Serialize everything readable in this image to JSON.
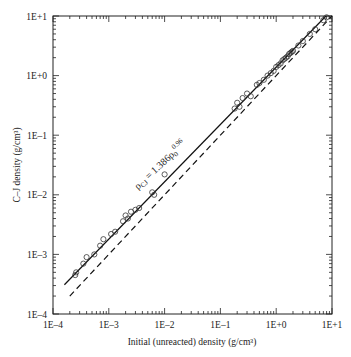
{
  "chart_data": {
    "type": "scatter",
    "title": "",
    "xlabel": "Initial (unreacted) density (g/cm³)",
    "ylabel": "C–J density (g/cm³)",
    "xscale": "log",
    "yscale": "log",
    "xlim": [
      0.0001,
      10
    ],
    "ylim": [
      0.0001,
      10
    ],
    "x_ticks": [
      "1E–4",
      "1E–3",
      "1E–2",
      "1E–1",
      "1E+0",
      "1E+1"
    ],
    "y_ticks": [
      "1E–4",
      "1E–3",
      "1E–2",
      "1E–1",
      "1E+0",
      "1E+1"
    ],
    "grid": false,
    "legend": null,
    "annotation": {
      "text": "ρCJ = 1.386ρ0^0.96",
      "main": "ρ",
      "sub1": "CJ",
      "eq": " = 1.386ρ",
      "sub2": "0",
      "sup": "0.96"
    },
    "series": [
      {
        "name": "data",
        "style": "open-circle",
        "points": [
          [
            0.00025,
            0.00045
          ],
          [
            0.00026,
            0.0005
          ],
          [
            0.00035,
            0.0007
          ],
          [
            0.0004,
            0.0009
          ],
          [
            0.00055,
            0.001
          ],
          [
            0.0007,
            0.0014
          ],
          [
            0.0008,
            0.0018
          ],
          [
            0.0011,
            0.0022
          ],
          [
            0.0013,
            0.0024
          ],
          [
            0.0018,
            0.0036
          ],
          [
            0.002,
            0.0045
          ],
          [
            0.0022,
            0.004
          ],
          [
            0.0025,
            0.0052
          ],
          [
            0.003,
            0.0056
          ],
          [
            0.0035,
            0.006
          ],
          [
            0.006,
            0.011
          ],
          [
            0.0065,
            0.01
          ],
          [
            0.01,
            0.022
          ],
          [
            0.18,
            0.28
          ],
          [
            0.2,
            0.35
          ],
          [
            0.22,
            0.3
          ],
          [
            0.25,
            0.42
          ],
          [
            0.3,
            0.5
          ],
          [
            0.35,
            0.45
          ],
          [
            0.45,
            0.7
          ],
          [
            0.5,
            0.75
          ],
          [
            0.6,
            0.85
          ],
          [
            0.7,
            1.0
          ],
          [
            0.8,
            1.1
          ],
          [
            0.9,
            1.2
          ],
          [
            1.0,
            1.4
          ],
          [
            1.1,
            1.5
          ],
          [
            1.2,
            1.6
          ],
          [
            1.3,
            1.8
          ],
          [
            1.4,
            1.9
          ],
          [
            1.5,
            2.0
          ],
          [
            1.6,
            2.1
          ],
          [
            1.7,
            2.3
          ],
          [
            1.8,
            2.4
          ],
          [
            1.9,
            2.5
          ],
          [
            2.0,
            2.6
          ],
          [
            2.5,
            3.2
          ],
          [
            3.0,
            3.8
          ],
          [
            4.0,
            5.0
          ],
          [
            5.0,
            6.0
          ],
          [
            7.0,
            8.5
          ],
          [
            8.0,
            9.5
          ]
        ]
      },
      {
        "name": "fit ρCJ = 1.386ρ0^0.96",
        "style": "solid-line",
        "x": [
          0.00016,
          7.8
        ],
        "y": [
          0.00031,
          10
        ]
      },
      {
        "name": "identity ρCJ = ρ0",
        "style": "dashed-line",
        "x": [
          0.0002,
          10
        ],
        "y": [
          0.0002,
          10
        ]
      }
    ]
  }
}
